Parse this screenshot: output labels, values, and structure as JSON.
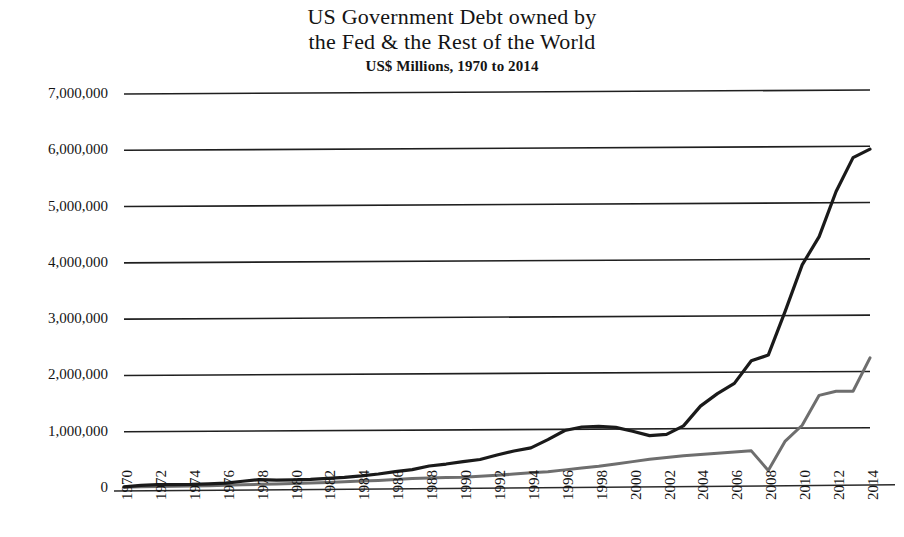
{
  "chart_data": {
    "type": "line",
    "title": "US Government Debt owned by the Fed & the Rest of the World",
    "title_lines": [
      "US Government Debt owned by",
      "the Fed & the Rest of the World"
    ],
    "subtitle": "US$ Millions, 1970 to 2014",
    "xlabel": "",
    "ylabel": "",
    "xlim": [
      1970,
      2014
    ],
    "ylim": [
      0,
      7000000
    ],
    "grid": true,
    "legend": "none",
    "y_ticks": [
      0,
      1000000,
      2000000,
      3000000,
      4000000,
      5000000,
      6000000,
      7000000
    ],
    "y_tick_labels": [
      "0",
      "1,000,000",
      "2,000,000",
      "3,000,000",
      "4,000,000",
      "5,000,000",
      "6,000,000",
      "7,000,000"
    ],
    "x_ticks": [
      1970,
      1972,
      1974,
      1976,
      1978,
      1980,
      1982,
      1984,
      1986,
      1988,
      1990,
      1992,
      1994,
      1996,
      1998,
      2000,
      2002,
      2004,
      2006,
      2008,
      2010,
      2012,
      2014
    ],
    "x_tick_labels": [
      "1970",
      "1972",
      "1974",
      "1976",
      "1978",
      "1980",
      "1982",
      "1984",
      "1986",
      "1988",
      "1990",
      "1992",
      "1994",
      "1996",
      "1998",
      "2000",
      "2002",
      "2004",
      "2006",
      "2008",
      "2010",
      "2012",
      "2014"
    ],
    "x": [
      1970,
      1971,
      1972,
      1973,
      1974,
      1975,
      1976,
      1977,
      1978,
      1979,
      1980,
      1981,
      1982,
      1983,
      1984,
      1985,
      1986,
      1987,
      1988,
      1989,
      1990,
      1991,
      1992,
      1993,
      1994,
      1995,
      1996,
      1997,
      1998,
      1999,
      2000,
      2001,
      2002,
      2003,
      2004,
      2005,
      2006,
      2007,
      2008,
      2009,
      2010,
      2011,
      2012,
      2013,
      2014
    ],
    "series": [
      {
        "name": "Rest of the World",
        "color": "#1a1a1a",
        "width": 3.2,
        "values": [
          20000,
          45000,
          58000,
          56000,
          57000,
          66000,
          78000,
          109000,
          137000,
          124000,
          129000,
          136000,
          150000,
          167000,
          192000,
          225000,
          265000,
          300000,
          362000,
          395000,
          435000,
          472000,
          550000,
          620000,
          675000,
          820000,
          980000,
          1040000,
          1050000,
          1030000,
          960000,
          880000,
          900000,
          1050000,
          1400000,
          1620000,
          1800000,
          2200000,
          2300000,
          3080000,
          3900000,
          4400000,
          5200000,
          5800000,
          5950000
        ]
      },
      {
        "name": "Federal Reserve",
        "color": "#6e6e6e",
        "width": 3.0,
        "values": [
          15000,
          20000,
          22000,
          25000,
          28000,
          32000,
          38000,
          45000,
          52000,
          58000,
          65000,
          72000,
          78000,
          90000,
          100000,
          110000,
          125000,
          140000,
          150000,
          155000,
          160000,
          175000,
          190000,
          210000,
          230000,
          250000,
          280000,
          310000,
          340000,
          380000,
          420000,
          460000,
          490000,
          520000,
          540000,
          560000,
          580000,
          600000,
          250000,
          770000,
          1050000,
          1580000,
          1650000,
          1650000,
          2240000
        ]
      }
    ]
  }
}
